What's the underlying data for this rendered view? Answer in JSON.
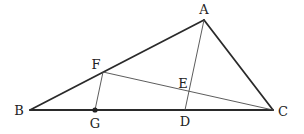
{
  "diagram": {
    "type": "geometry-triangle",
    "points": {
      "A": {
        "label": "A",
        "x": 204,
        "y": 20,
        "label_x": 204,
        "label_y": 14
      },
      "B": {
        "label": "B",
        "x": 30,
        "y": 110,
        "label_x": 19,
        "label_y": 115
      },
      "C": {
        "label": "C",
        "x": 273,
        "y": 110,
        "label_x": 283,
        "label_y": 116
      },
      "D": {
        "label": "D",
        "x": 185,
        "y": 110,
        "label_x": 185,
        "label_y": 126
      },
      "E": {
        "label": "E",
        "x": 189,
        "y": 91,
        "label_x": 183,
        "label_y": 88
      },
      "F": {
        "label": "F",
        "x": 103,
        "y": 72,
        "label_x": 96,
        "label_y": 69
      },
      "G": {
        "label": "G",
        "x": 95,
        "y": 110,
        "label_x": 95,
        "label_y": 128
      }
    },
    "segments": [
      {
        "name": "AB",
        "from": "A",
        "to": "B",
        "style": "thick"
      },
      {
        "name": "AC",
        "from": "A",
        "to": "C",
        "style": "thick"
      },
      {
        "name": "BC",
        "from": "B",
        "to": "C",
        "style": "thick"
      },
      {
        "name": "AD",
        "from": "A",
        "to": "D",
        "style": "thin"
      },
      {
        "name": "FC",
        "from": "F",
        "to": "C",
        "style": "thin"
      },
      {
        "name": "FG",
        "from": "F",
        "to": "G",
        "style": "thin"
      }
    ],
    "marked_points": [
      "G"
    ],
    "colors": {
      "stroke": "#2a2a2a",
      "thin_stroke": "#4a4a4a",
      "background": "#ffffff"
    }
  }
}
